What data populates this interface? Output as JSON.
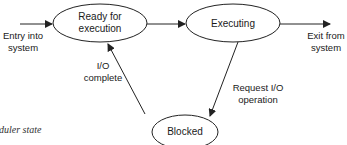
{
  "diagram": {
    "type": "state-transition",
    "states": [
      {
        "id": "ready",
        "label_line1": "Ready for",
        "label_line2": "execution"
      },
      {
        "id": "executing",
        "label": "Executing"
      },
      {
        "id": "blocked",
        "label": "Blocked"
      }
    ],
    "transitions": [
      {
        "from": "entry",
        "to": "ready",
        "label_line1": "Entry into",
        "label_line2": "system"
      },
      {
        "from": "ready",
        "to": "executing",
        "label": ""
      },
      {
        "from": "executing",
        "to": "exit",
        "label_line1": "Exit from",
        "label_line2": "system"
      },
      {
        "from": "executing",
        "to": "blocked",
        "label_line1": "Request I/O",
        "label_line2": "operation"
      },
      {
        "from": "blocked",
        "to": "ready",
        "label_line1": "I/O",
        "label_line2": "complete"
      }
    ],
    "caption": "duler state"
  },
  "colors": {
    "stroke": "#222222",
    "text": "#1a1a1a",
    "background": "#ffffff"
  }
}
